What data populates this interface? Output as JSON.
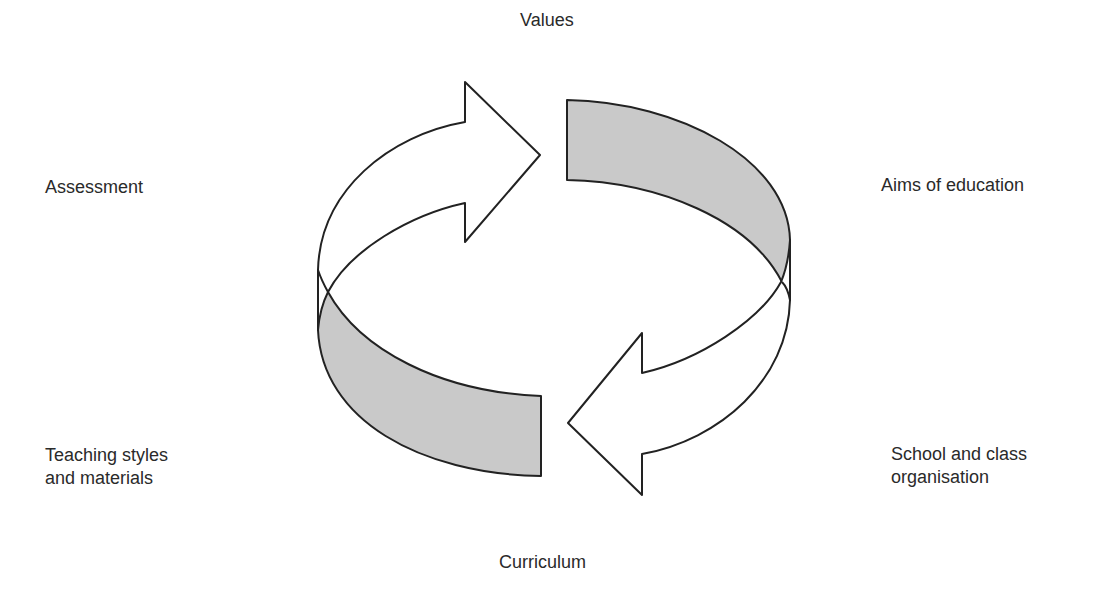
{
  "diagram": {
    "type": "cycle",
    "colors": {
      "stroke": "#222222",
      "arrow_fill": "#ffffff",
      "band_fill": "#c9c9c9",
      "text": "#2a2a2a",
      "background": "#ffffff"
    },
    "labels": {
      "top": "Values",
      "top_right": "Aims of education",
      "bottom_right": [
        "School and class",
        "organisation"
      ],
      "bottom": "Curriculum",
      "bottom_left": [
        "Teaching styles",
        "and materials"
      ],
      "top_left": "Assessment"
    },
    "elements": [
      {
        "name": "top-left-arrow",
        "direction": "clockwise",
        "fill": "white"
      },
      {
        "name": "top-right-band",
        "fill": "gray"
      },
      {
        "name": "bottom-right-arrow",
        "direction": "clockwise",
        "fill": "white"
      },
      {
        "name": "bottom-left-band",
        "fill": "gray"
      }
    ]
  }
}
